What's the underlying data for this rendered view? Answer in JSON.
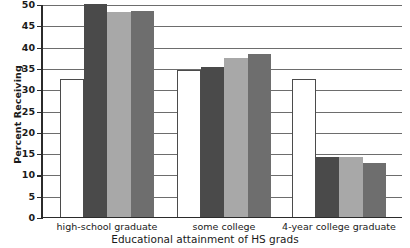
{
  "chart_data": {
    "type": "bar",
    "title": "",
    "xlabel": "Educational attainment of HS grads",
    "ylabel": "Percent Receiving",
    "ylim": [
      0,
      50
    ],
    "ytick_step": 5,
    "yticks": [
      50,
      45,
      40,
      35,
      30,
      25,
      20,
      15,
      10,
      5,
      0
    ],
    "grid": true,
    "legend": "none",
    "categories": [
      "high-school graduate",
      "some college",
      "4-year college graduate"
    ],
    "series": [
      {
        "name": "series-1",
        "color": "#ffffff",
        "style": "white-outlined",
        "values": [
          32.6,
          34.8,
          32.7
        ]
      },
      {
        "name": "series-2",
        "color": "#4a4a4a",
        "style": "dark-gray",
        "values": [
          50.3,
          35.4,
          14.3
        ]
      },
      {
        "name": "series-3",
        "color": "#a8a8a8",
        "style": "light-gray",
        "values": [
          48.3,
          37.5,
          14.3
        ]
      },
      {
        "name": "series-4",
        "color": "#6e6e6e",
        "style": "medium-gray",
        "values": [
          48.7,
          38.6,
          13.0
        ]
      }
    ]
  },
  "axis": {
    "y_title": "Percent Receiving",
    "x_title": "Educational attainment of HS grads",
    "y_labels": [
      "50",
      "45",
      "40",
      "35",
      "30",
      "25",
      "20",
      "15",
      "10",
      "5",
      "0"
    ]
  },
  "categories": [
    {
      "label": "high-school graduate"
    },
    {
      "label": "some college"
    },
    {
      "label": "4-year college graduate"
    }
  ],
  "colors": {
    "series_1": "#ffffff",
    "series_2": "#4a4a4a",
    "series_3": "#a8a8a8",
    "series_4": "#6e6e6e",
    "gridline": "#6d6d6d",
    "axis": "#2b2b2b",
    "text": "#1a1a1a"
  }
}
